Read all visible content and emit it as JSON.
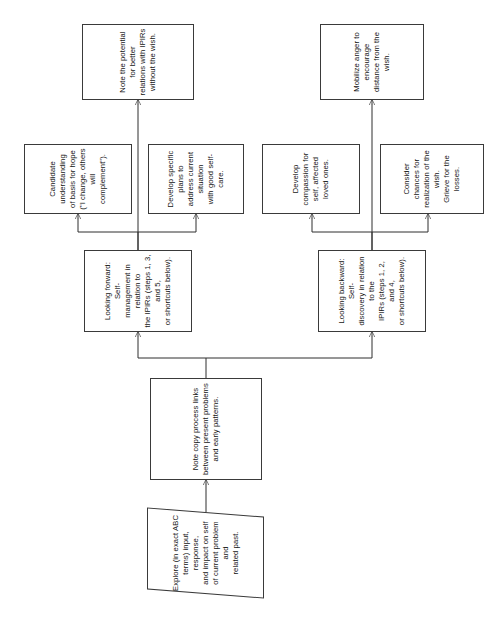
{
  "diagram": {
    "type": "flowchart",
    "orientation": "rotated-90-ccw",
    "stroke_color": "#2e2e2e",
    "text_color": "#141414",
    "background_color": "#ffffff",
    "nodes": [
      {
        "id": "explore",
        "shape": "parallelogram",
        "text": "Explore (in exact ABC\nterms) input, response,\nand impact on self\nof current problem and\nrelated past."
      },
      {
        "id": "note-copy-process",
        "shape": "rectangle",
        "text": "Note copy process links\nbetween present problems\nand early patterns."
      },
      {
        "id": "looking-forward",
        "shape": "rectangle",
        "text": "Looking forward: Self-\nmanagement in relation to\nthe IPIRs (steps 1, 3, and 5,\nor shortcuts below)."
      },
      {
        "id": "looking-backward",
        "shape": "rectangle",
        "text": "Looking backward: Self-\ndiscovery in relation to the\nIPIRs (steps 1, 2, and 4,\nor shortcuts below)."
      },
      {
        "id": "candidate-understanding",
        "shape": "rectangle",
        "text": "Candidate understanding\nof basis for hope\n(\"I change, others will\ncomplement\")."
      },
      {
        "id": "develop-specific-plans",
        "shape": "rectangle",
        "text": "Develop specific plans to\naddress current situation\nwith good self-care."
      },
      {
        "id": "note-potential",
        "shape": "rectangle",
        "text": "Note the potential for better\nrelations with IPIRs\nwithout the wish."
      },
      {
        "id": "develop-compassion",
        "shape": "rectangle",
        "text": "Develop compassion for\nself, affected loved ones."
      },
      {
        "id": "consider-chances",
        "shape": "rectangle",
        "text": "Consider chances for\nrealization of the wish.\nGrieve for the losses."
      },
      {
        "id": "mobilize-anger",
        "shape": "rectangle",
        "text": "Mobilize anger to encourage\ndistance from the wish."
      }
    ],
    "edges": [
      {
        "from": "explore",
        "to": "note-copy-process"
      },
      {
        "from": "note-copy-process",
        "to": "looking-forward"
      },
      {
        "from": "note-copy-process",
        "to": "looking-backward"
      },
      {
        "from": "looking-forward",
        "to": "candidate-understanding"
      },
      {
        "from": "looking-forward",
        "to": "develop-specific-plans"
      },
      {
        "from": "looking-forward",
        "to": "note-potential"
      },
      {
        "from": "looking-backward",
        "to": "develop-compassion"
      },
      {
        "from": "looking-backward",
        "to": "consider-chances"
      },
      {
        "from": "looking-backward",
        "to": "mobilize-anger"
      }
    ]
  }
}
